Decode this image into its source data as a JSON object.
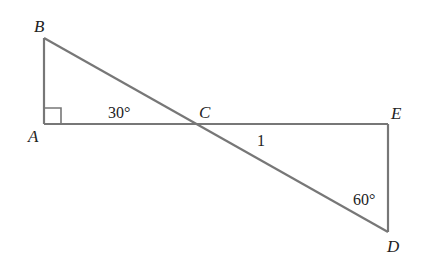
{
  "diagram": {
    "type": "geometry",
    "line_color": "#777777",
    "text_color": "#222222",
    "points": {
      "A": {
        "label": "A",
        "x": 44,
        "y": 124
      },
      "B": {
        "label": "B",
        "x": 44,
        "y": 38
      },
      "C": {
        "label": "C",
        "x": 195,
        "y": 124
      },
      "D": {
        "label": "D",
        "x": 388,
        "y": 232
      },
      "E": {
        "label": "E",
        "x": 388,
        "y": 124
      }
    },
    "segments": [
      {
        "from": "A",
        "to": "B"
      },
      {
        "from": "A",
        "to": "E"
      },
      {
        "from": "B",
        "to": "D"
      },
      {
        "from": "E",
        "to": "D"
      }
    ],
    "right_angle_marker": {
      "at": "A"
    },
    "annotations": {
      "angle_acb": "30°",
      "segment_cd": "1",
      "angle_edc": "60°"
    }
  }
}
